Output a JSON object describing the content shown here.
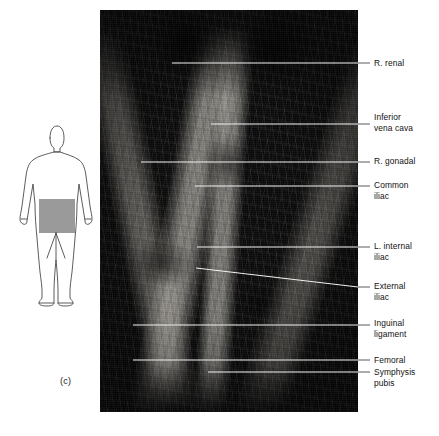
{
  "figure": {
    "caption": "(c)",
    "type": "anatomical-dissection-photograph",
    "photo": {
      "description": "grayscale cadaver dissection of abdominal and pelvic vasculature",
      "x": 100,
      "y": 10,
      "width": 258,
      "height": 402
    }
  },
  "body_diagram": {
    "name": "anterior human body outline",
    "highlight_region": "pelvic / lower abdominal region",
    "highlight_color": "#9a9a9a",
    "outline_color": "#4a4a4a"
  },
  "labels": [
    {
      "id": "r-renal",
      "text": "R. renal",
      "x": 374,
      "y": 58,
      "line_y": 63,
      "line_start_x": 172,
      "line_end_x": 370
    },
    {
      "id": "inferior-vena-cava",
      "text": "Inferior\nvena cava",
      "x": 374,
      "y": 112,
      "line_y": 124,
      "line_start_x": 211,
      "line_end_x": 370
    },
    {
      "id": "r-gonadal",
      "text": "R. gonadal",
      "x": 374,
      "y": 156,
      "line_y": 162,
      "line_start_x": 141,
      "line_end_x": 370
    },
    {
      "id": "common-iliac",
      "text": "Common\niliac",
      "x": 374,
      "y": 180,
      "line_y": 186,
      "line_start_x": 195,
      "line_end_x": 370
    },
    {
      "id": "l-internal-iliac",
      "text": "L. internal\niliac",
      "x": 374,
      "y": 241,
      "line_y": 247,
      "line_start_x": 197,
      "line_end_x": 370
    },
    {
      "id": "external-iliac",
      "text": "External\niliac",
      "x": 374,
      "y": 281,
      "line_y": 287,
      "line_start_x": 196,
      "line_end_x": 370
    },
    {
      "id": "inguinal-ligament",
      "text": "Inguinal\nligament",
      "x": 374,
      "y": 318,
      "line_y": 325,
      "line_start_x": 133,
      "line_end_x": 370
    },
    {
      "id": "femoral",
      "text": "Femoral",
      "x": 374,
      "y": 355,
      "line_y": 360,
      "line_start_x": 133,
      "line_end_x": 370
    },
    {
      "id": "symphysis-pubis",
      "text": "Symphysis\npubis",
      "x": 374,
      "y": 367,
      "line_y": 372,
      "line_start_x": 208,
      "line_end_x": 370
    }
  ],
  "colors": {
    "label_text": "#111111",
    "leader_outside": "#5a5a5a",
    "leader_inside": "#f2f2f2",
    "background": "#ffffff"
  }
}
